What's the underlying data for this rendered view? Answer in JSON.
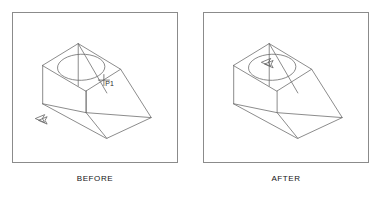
{
  "figure": {
    "background_color": "#ffffff",
    "line_color": "#6d6d6d",
    "border_color": "#8b8b8b",
    "text_color": "#141414"
  },
  "panels": [
    {
      "id": "before",
      "caption": "BEFORE",
      "drawing": {
        "type": "isometric-wireframe",
        "object": "truncated wedge solid with circular through-hole in top face",
        "annotations": [
          {
            "name": "point-marker",
            "label": "P1",
            "glyph": "crosshair"
          },
          {
            "name": "cursor-arrow",
            "label": "",
            "glyph": "left-arrow",
            "position": "lower-left base vertex"
          }
        ]
      }
    },
    {
      "id": "after",
      "caption": "AFTER",
      "drawing": {
        "type": "isometric-wireframe",
        "object": "truncated wedge solid with circular through-hole in top face",
        "annotations": [
          {
            "name": "cursor-arrow",
            "label": "",
            "glyph": "left-arrow",
            "position": "inside top-face hole"
          }
        ]
      }
    }
  ]
}
